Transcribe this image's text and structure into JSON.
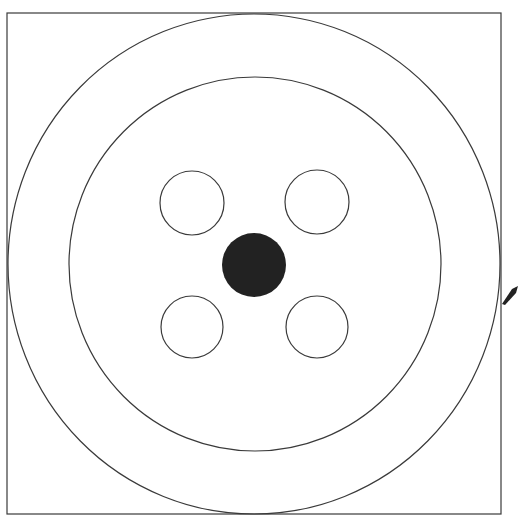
{
  "diagram": {
    "canvas": {
      "width": 518,
      "height": 521,
      "background": "#ffffff"
    },
    "colors": {
      "stroke": "#3a3a3a",
      "fill_dark": "#222222",
      "background": "#ffffff"
    },
    "frame": {
      "x": 7,
      "y": 13,
      "width": 494,
      "height": 501
    },
    "outer_ring": {
      "cx": 254,
      "cy": 264,
      "rx": 246,
      "ry": 250
    },
    "inner_ring": {
      "cx": 255,
      "cy": 264,
      "rx": 186,
      "ry": 187
    },
    "center_dot": {
      "cx": 254,
      "cy": 265,
      "r": 32
    },
    "holes": [
      {
        "position": "top-left",
        "cx": 192,
        "cy": 203,
        "r": 32
      },
      {
        "position": "top-right",
        "cx": 317,
        "cy": 202,
        "r": 32
      },
      {
        "position": "bottom-left",
        "cx": 192,
        "cy": 327,
        "r": 31
      },
      {
        "position": "bottom-right",
        "cx": 317,
        "cy": 327,
        "r": 31
      }
    ],
    "pointer": {
      "points": "502,304 512,289 518,286 516,293 505,305"
    }
  }
}
